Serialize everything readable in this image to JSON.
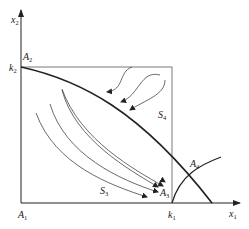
{
  "diagram": {
    "axes": {
      "x": {
        "name": "x",
        "sub": "1"
      },
      "y": {
        "name": "x",
        "sub": "2"
      }
    },
    "points": {
      "A1": {
        "name": "A",
        "sub": "1"
      },
      "A2": {
        "name": "A",
        "sub": "2"
      },
      "A3": {
        "name": "A",
        "sub": "3"
      },
      "A4": {
        "name": "A",
        "sub": "4"
      }
    },
    "intercepts": {
      "k1": {
        "name": "k",
        "sub": "1"
      },
      "k2": {
        "name": "k",
        "sub": "2"
      }
    },
    "regions": {
      "S3": {
        "name": "S",
        "sub": "3"
      },
      "S4": {
        "name": "S",
        "sub": "4"
      }
    },
    "colors": {
      "stroke": "#222222",
      "thin": "#444444",
      "background": "#ffffff"
    }
  }
}
